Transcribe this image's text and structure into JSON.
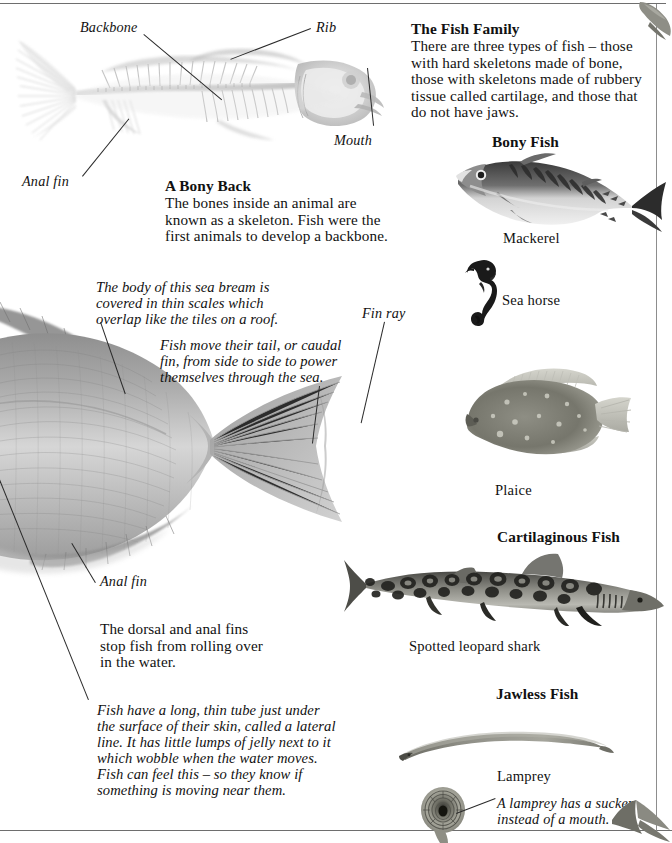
{
  "page": {
    "title": "The Fish Family",
    "background": "#ffffff",
    "ink": "#111111",
    "rule_color": "#6e6e6e"
  },
  "skeleton_panel": {
    "labels": [
      {
        "id": "backbone",
        "text": "Backbone"
      },
      {
        "id": "rib",
        "text": "Rib"
      },
      {
        "id": "mouth",
        "text": "Mouth"
      },
      {
        "id": "anal-fin",
        "text": "Anal fin"
      }
    ]
  },
  "bony_back": {
    "heading": "A Bony Back",
    "paragraph": [
      "The bones inside an animal are",
      "known as a skeleton. Fish were the",
      "first animals to develop a backbone."
    ]
  },
  "fish_family": {
    "heading": "The Fish Family",
    "paragraph": [
      "There are three types of fish – those",
      "with hard skeletons made of bone,",
      "those with skeletons made of rubbery",
      "tissue called cartilage, and those that",
      "do not have jaws."
    ]
  },
  "groups": [
    {
      "id": "bony-fish",
      "heading": "Bony Fish"
    },
    {
      "id": "cartilaginous-fish",
      "heading": "Cartilaginous Fish"
    },
    {
      "id": "jawless-fish",
      "heading": "Jawless Fish"
    }
  ],
  "specimens": [
    {
      "id": "mackerel",
      "caption": "Mackerel"
    },
    {
      "id": "sea-horse",
      "caption": "Sea horse"
    },
    {
      "id": "plaice",
      "caption": "Plaice"
    },
    {
      "id": "spotted-leopard-shark",
      "caption": "Spotted leopard shark"
    },
    {
      "id": "lamprey",
      "caption": "Lamprey"
    }
  ],
  "sea_bream": {
    "scales_note": [
      "The body of this sea bream is",
      "covered in thin scales which",
      "overlap like the tiles on a roof."
    ],
    "caudal_note": [
      "Fish move their tail, or caudal",
      "fin, from side to side to power",
      "themselves through the sea."
    ],
    "fin_ray_label": "Fin ray",
    "anal_fin_label": "Anal fin",
    "dorsal_note": [
      "The dorsal and anal fins",
      "stop fish from rolling over",
      "in the water."
    ],
    "lateral_line_note": [
      "Fish have a long, thin tube just under",
      "the surface of their skin, called a lateral",
      "line. It has little lumps of jelly next to it",
      "which wobble when the water moves.",
      "Fish can feel this – so they know if",
      "something is moving near them."
    ]
  },
  "lamprey_note": [
    "A lamprey has a sucker",
    "instead of a mouth."
  ]
}
